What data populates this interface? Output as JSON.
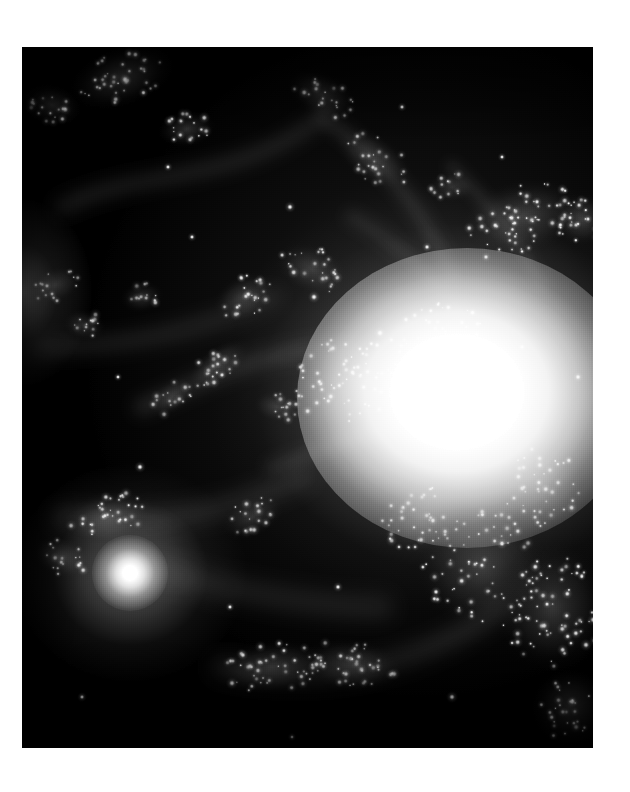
{
  "page": {
    "background_color": "#ffffff",
    "width": 630,
    "height": 792
  },
  "figure": {
    "name": "astronomical-image",
    "kind": "grayscale telescope photograph",
    "plate": {
      "left": 22,
      "top": 47,
      "width": 571,
      "height": 701,
      "sky_color": "#000000",
      "highlight_color": "#ffffff"
    },
    "caption": "",
    "title": "",
    "scale_bar": "",
    "orientation_label": ""
  },
  "features": {
    "primary_core": {
      "label": "bright saturated galaxy core",
      "cx_pct": 78,
      "cy_pct": 50,
      "radius_px": 165,
      "peak_color": "#ffffff"
    },
    "secondary_core": {
      "label": "compact bright knot lower-left",
      "cx_pct": 19,
      "cy_pct": 75,
      "radius_px": 38,
      "peak_color": "#ffffff"
    },
    "upper_blob": {
      "label": "diffuse star knot upper-centre",
      "cx_pct": 52,
      "cy_pct": 17,
      "radius_px": 22
    },
    "right_cluster": {
      "label": "dense cluster at right edge",
      "cx_pct": 97,
      "cy_pct": 24,
      "radius_px": 30
    },
    "left_glow": {
      "label": "diffuse glow at left edge",
      "cx_pct": 0,
      "cy_pct": 35,
      "radius_px": 55
    },
    "dark_lane": {
      "label": "dark dust lane upper-left quadrant",
      "cx_pct": 22,
      "cy_pct": 22
    }
  },
  "star_clusters": [
    {
      "cx": 100,
      "cy": 30,
      "rx": 48,
      "ry": 26,
      "rot": -18,
      "n": 40,
      "bright": 0.95
    },
    {
      "cx": 30,
      "cy": 58,
      "rx": 26,
      "ry": 18,
      "rot": 15,
      "n": 18,
      "bright": 0.8
    },
    {
      "cx": 165,
      "cy": 82,
      "rx": 26,
      "ry": 16,
      "rot": -8,
      "n": 20,
      "bright": 0.92
    },
    {
      "cx": 300,
      "cy": 48,
      "rx": 34,
      "ry": 20,
      "rot": 28,
      "n": 22,
      "bright": 0.7
    },
    {
      "cx": 352,
      "cy": 112,
      "rx": 40,
      "ry": 22,
      "rot": 34,
      "n": 26,
      "bright": 0.72
    },
    {
      "cx": 430,
      "cy": 140,
      "rx": 22,
      "ry": 14,
      "rot": 0,
      "n": 14,
      "bright": 0.66
    },
    {
      "cx": 500,
      "cy": 170,
      "rx": 56,
      "ry": 34,
      "rot": -12,
      "n": 58,
      "bright": 0.98
    },
    {
      "cx": 560,
      "cy": 172,
      "rx": 26,
      "ry": 24,
      "rot": 0,
      "n": 26,
      "bright": 1.0
    },
    {
      "cx": 33,
      "cy": 238,
      "rx": 24,
      "ry": 16,
      "rot": -20,
      "n": 16,
      "bright": 0.78
    },
    {
      "cx": 62,
      "cy": 278,
      "rx": 20,
      "ry": 14,
      "rot": 10,
      "n": 13,
      "bright": 0.74
    },
    {
      "cx": 120,
      "cy": 250,
      "rx": 20,
      "ry": 14,
      "rot": -10,
      "n": 12,
      "bright": 0.7
    },
    {
      "cx": 222,
      "cy": 250,
      "rx": 30,
      "ry": 20,
      "rot": -30,
      "n": 24,
      "bright": 0.88
    },
    {
      "cx": 290,
      "cy": 222,
      "rx": 34,
      "ry": 22,
      "rot": 20,
      "n": 26,
      "bright": 0.82
    },
    {
      "cx": 196,
      "cy": 318,
      "rx": 34,
      "ry": 16,
      "rot": -38,
      "n": 24,
      "bright": 0.84
    },
    {
      "cx": 150,
      "cy": 350,
      "rx": 24,
      "ry": 14,
      "rot": -34,
      "n": 16,
      "bright": 0.72
    },
    {
      "cx": 255,
      "cy": 360,
      "rx": 22,
      "ry": 14,
      "rot": 12,
      "n": 14,
      "bright": 0.7
    },
    {
      "cx": 330,
      "cy": 330,
      "rx": 60,
      "ry": 46,
      "rot": -20,
      "n": 70,
      "bright": 0.96
    },
    {
      "cx": 420,
      "cy": 300,
      "rx": 54,
      "ry": 44,
      "rot": 10,
      "n": 56,
      "bright": 0.94
    },
    {
      "cx": 86,
      "cy": 470,
      "rx": 40,
      "ry": 24,
      "rot": -12,
      "n": 34,
      "bright": 0.92
    },
    {
      "cx": 40,
      "cy": 510,
      "rx": 26,
      "ry": 18,
      "rot": 20,
      "n": 18,
      "bright": 0.84
    },
    {
      "cx": 230,
      "cy": 470,
      "rx": 30,
      "ry": 18,
      "rot": -25,
      "n": 20,
      "bright": 0.76
    },
    {
      "cx": 250,
      "cy": 620,
      "rx": 52,
      "ry": 24,
      "rot": -6,
      "n": 48,
      "bright": 0.94
    },
    {
      "cx": 330,
      "cy": 618,
      "rx": 46,
      "ry": 24,
      "rot": 8,
      "n": 40,
      "bright": 0.9
    },
    {
      "cx": 460,
      "cy": 520,
      "rx": 60,
      "ry": 56,
      "rot": 0,
      "n": 76,
      "bright": 0.96
    },
    {
      "cx": 530,
      "cy": 560,
      "rx": 52,
      "ry": 60,
      "rot": 0,
      "n": 70,
      "bright": 0.94
    },
    {
      "cx": 520,
      "cy": 440,
      "rx": 40,
      "ry": 40,
      "rot": 0,
      "n": 42,
      "bright": 0.9
    },
    {
      "cx": 400,
      "cy": 470,
      "rx": 44,
      "ry": 34,
      "rot": -14,
      "n": 40,
      "bright": 0.88
    },
    {
      "cx": 548,
      "cy": 660,
      "rx": 34,
      "ry": 34,
      "rot": 0,
      "n": 30,
      "bright": 0.8
    }
  ],
  "field_stars": [
    {
      "cx": 268,
      "cy": 160,
      "r": 2.0
    },
    {
      "cx": 292,
      "cy": 250,
      "r": 2.2
    },
    {
      "cx": 405,
      "cy": 200,
      "r": 1.8
    },
    {
      "cx": 170,
      "cy": 190,
      "r": 1.6
    },
    {
      "cx": 358,
      "cy": 286,
      "r": 2.4
    },
    {
      "cx": 464,
      "cy": 210,
      "r": 1.8
    },
    {
      "cx": 118,
      "cy": 420,
      "r": 2.0
    },
    {
      "cx": 60,
      "cy": 650,
      "r": 1.6
    },
    {
      "cx": 316,
      "cy": 540,
      "r": 1.8
    },
    {
      "cx": 208,
      "cy": 560,
      "r": 1.6
    },
    {
      "cx": 430,
      "cy": 650,
      "r": 2.0
    },
    {
      "cx": 500,
      "cy": 300,
      "r": 2.0
    },
    {
      "cx": 146,
      "cy": 120,
      "r": 1.6
    },
    {
      "cx": 380,
      "cy": 60,
      "r": 1.6
    },
    {
      "cx": 556,
      "cy": 330,
      "r": 2.0
    },
    {
      "cx": 270,
      "cy": 690,
      "r": 1.4
    },
    {
      "cx": 96,
      "cy": 330,
      "r": 1.5
    },
    {
      "cx": 480,
      "cy": 110,
      "r": 1.5
    }
  ],
  "filaments": [
    {
      "d": "M 40 160 C 120 120, 210 140, 300 70",
      "w": 16,
      "o": 0.16
    },
    {
      "d": "M 300 70 C 360 110, 400 160, 430 230",
      "w": 14,
      "o": 0.18
    },
    {
      "d": "M 20 300 C 90 300, 170 290, 250 250",
      "w": 18,
      "o": 0.15
    },
    {
      "d": "M 120 360 C 190 330, 250 300, 330 300",
      "w": 16,
      "o": 0.2
    },
    {
      "d": "M 40 470 C 120 480, 200 470, 280 430",
      "w": 20,
      "o": 0.18
    },
    {
      "d": "M 120 520 C 200 540, 280 560, 360 560",
      "w": 22,
      "o": 0.16
    },
    {
      "d": "M 200 620 C 300 640, 400 620, 480 560",
      "w": 20,
      "o": 0.18
    },
    {
      "d": "M 330 170 C 400 210, 440 260, 470 320",
      "w": 14,
      "o": 0.14
    },
    {
      "d": "M 430 120 C 470 160, 500 200, 520 240",
      "w": 12,
      "o": 0.14
    },
    {
      "d": "M 250 420 C 310 400, 360 380, 420 370",
      "w": 14,
      "o": 0.16
    }
  ]
}
